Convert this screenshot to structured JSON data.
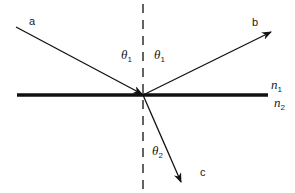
{
  "diagram": {
    "title": "",
    "type": "reflection-refraction",
    "colors": {
      "ink": "#111111",
      "background": "#ffffff"
    },
    "rays": {
      "incident": {
        "label": "a"
      },
      "reflected": {
        "label": "b"
      },
      "refracted": {
        "label": "c"
      }
    },
    "angles": {
      "incident": {
        "symbol": "θ",
        "subscript": "1"
      },
      "reflected": {
        "symbol": "θ",
        "subscript": "1"
      },
      "refracted": {
        "symbol": "θ",
        "subscript": "2"
      }
    },
    "media": {
      "upper": {
        "symbol": "n",
        "subscript": "1"
      },
      "lower": {
        "symbol": "n",
        "subscript": "2"
      }
    },
    "normal": {
      "style": "dashed"
    },
    "interface": {
      "style": "thick-solid"
    }
  }
}
